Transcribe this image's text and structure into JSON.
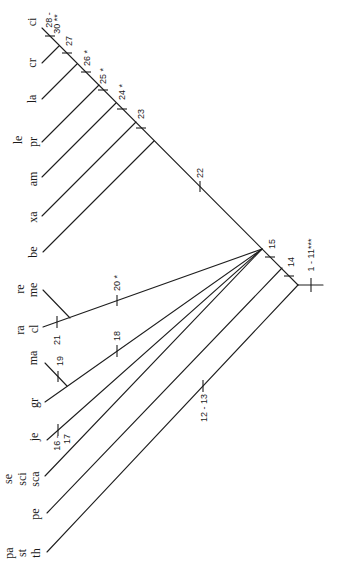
{
  "figure": {
    "type": "cladogram",
    "orientation": "rotated 90 degrees counter-clockwise",
    "line_color": "#1e1e1e",
    "background": "#ffffff"
  },
  "taxa": [
    {
      "id": "ci",
      "labels": [
        "ci"
      ]
    },
    {
      "id": "cr",
      "labels": [
        "cr"
      ]
    },
    {
      "id": "la",
      "labels": [
        "la"
      ]
    },
    {
      "id": "pr",
      "labels": [
        "le",
        "pr"
      ]
    },
    {
      "id": "am",
      "labels": [
        "am"
      ]
    },
    {
      "id": "xa",
      "labels": [
        "xa"
      ]
    },
    {
      "id": "be",
      "labels": [
        "be"
      ]
    },
    {
      "id": "me",
      "labels": [
        "re",
        "me"
      ]
    },
    {
      "id": "cl",
      "labels": [
        "ra",
        "cl"
      ]
    },
    {
      "id": "ma",
      "labels": [
        "ma"
      ]
    },
    {
      "id": "gr",
      "labels": [
        "gr"
      ]
    },
    {
      "id": "je",
      "labels": [
        "je"
      ]
    },
    {
      "id": "sca",
      "labels": [
        "se",
        "sci",
        "sca"
      ]
    },
    {
      "id": "pe",
      "labels": [
        "pe"
      ]
    },
    {
      "id": "th",
      "labels": [
        "pa",
        "st",
        "th"
      ]
    }
  ],
  "characters": [
    {
      "branch": "root stem",
      "lines": [
        "1 - 11***"
      ]
    },
    {
      "branch": "th",
      "lines": [
        "12 - 13"
      ]
    },
    {
      "branch": "ingroup (pe + rest)",
      "lines": [
        "14"
      ]
    },
    {
      "branch": "polytomy clade",
      "lines": [
        "15"
      ]
    },
    {
      "branch": "je",
      "lines": [
        "16 -",
        "17"
      ]
    },
    {
      "branch": "gr + ma",
      "lines": [
        "18"
      ]
    },
    {
      "branch": "ma",
      "lines": [
        "19"
      ]
    },
    {
      "branch": "cl + me",
      "lines": [
        "20 *"
      ]
    },
    {
      "branch": "cl",
      "lines": [
        "21"
      ]
    },
    {
      "branch": "be + xa + am + pr + la + cr + ci",
      "lines": [
        "22"
      ]
    },
    {
      "branch": "xa + am + pr + la + cr + ci",
      "lines": [
        "23"
      ]
    },
    {
      "branch": "pr + la + cr + ci",
      "lines": [
        "24 *"
      ]
    },
    {
      "branch": "la + cr + ci",
      "lines": [
        "25 *"
      ]
    },
    {
      "branch": "cr + ci",
      "lines": [
        "26 *"
      ]
    },
    {
      "branch": "ci (above cr node)",
      "lines": [
        "27"
      ]
    },
    {
      "branch": "ci",
      "lines": [
        "28 -",
        "30 **"
      ]
    }
  ],
  "topology": "(th,(pe,((cl,me),(gr,ma),je,sca,(be,(xa,(am,(pr,(la,(cr,ci)))))))))"
}
